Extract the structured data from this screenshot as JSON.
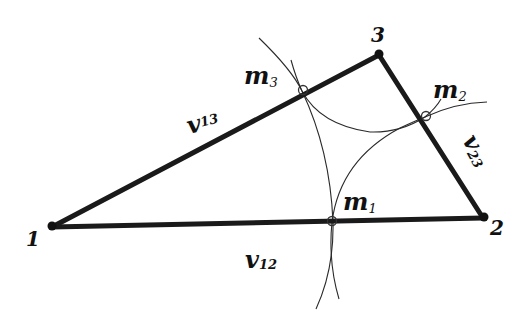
{
  "diagram": {
    "type": "triangle-with-midpoint-arcs",
    "colors": {
      "edge": "#1a1a1a",
      "arc": "#2a2a2a",
      "background": "#ffffff"
    },
    "vertices": [
      {
        "id": "1",
        "label": "1"
      },
      {
        "id": "2",
        "label": "2"
      },
      {
        "id": "3",
        "label": "3"
      }
    ],
    "edges": [
      {
        "id": "v12",
        "main": "v",
        "sub": "12"
      },
      {
        "id": "v13",
        "main": "v",
        "sub": "13"
      },
      {
        "id": "v23",
        "main": "v",
        "sub": "23"
      }
    ],
    "points": [
      {
        "id": "m1",
        "main": "m",
        "sub": "1"
      },
      {
        "id": "m2",
        "main": "m",
        "sub": "2"
      },
      {
        "id": "m3",
        "main": "m",
        "sub": "3"
      }
    ]
  }
}
